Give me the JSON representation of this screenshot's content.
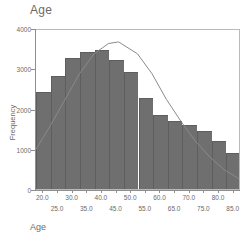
{
  "chart_data": {
    "type": "bar",
    "title": "Age",
    "xlabel": "Age",
    "ylabel": "Frequency",
    "xlim": [
      17.5,
      87.5
    ],
    "ylim": [
      0,
      4000
    ],
    "grid": false,
    "legend": null,
    "bin_width": 5,
    "bin_centers": [
      20.0,
      25.0,
      30.0,
      35.0,
      40.0,
      45.0,
      50.0,
      55.0,
      60.0,
      65.0,
      70.0,
      75.0,
      80.0,
      85.0
    ],
    "bin_edges": [
      17.5,
      22.5,
      27.5,
      32.5,
      37.5,
      42.5,
      47.5,
      52.5,
      57.5,
      62.5,
      67.5,
      72.5,
      77.5,
      82.5,
      87.5
    ],
    "categories": [
      "20.0",
      "25.0",
      "30.0",
      "35.0",
      "40.0",
      "45.0",
      "50.0",
      "55.0",
      "60.0",
      "65.0",
      "70.0",
      "75.0",
      "80.0",
      "85.0"
    ],
    "values": [
      2400,
      2800,
      3250,
      3400,
      3450,
      3200,
      2900,
      2250,
      1850,
      1700,
      1600,
      1450,
      1200,
      900
    ],
    "xticks_row1": [
      "20.0",
      "30.0",
      "40.0",
      "50.0",
      "60.0",
      "70.0",
      "80.0"
    ],
    "xticks_row1_values": [
      20.0,
      30.0,
      40.0,
      50.0,
      60.0,
      70.0,
      80.0
    ],
    "xticks_row2": [
      "25.0",
      "35.0",
      "45.0",
      "55.0",
      "65.0",
      "75.0",
      "85.0"
    ],
    "xticks_row2_values": [
      25.0,
      35.0,
      45.0,
      55.0,
      65.0,
      75.0,
      85.0
    ],
    "yticks": [
      "0",
      "1000",
      "2000",
      "3000",
      "4000"
    ],
    "yticks_values": [
      0,
      1000,
      2000,
      3000,
      4000
    ],
    "overlay": {
      "name": "normal-curve",
      "type": "line",
      "mean": 46.0,
      "peak_value": 3700,
      "x": [
        17.5,
        22.5,
        27.5,
        32.5,
        37.5,
        42.5,
        46.0,
        52.5,
        57.5,
        62.5,
        67.5,
        72.5,
        77.5,
        82.5,
        87.5
      ],
      "y": [
        1000,
        1600,
        2250,
        2900,
        3400,
        3660,
        3700,
        3400,
        2900,
        2250,
        1700,
        1200,
        800,
        480,
        260
      ]
    },
    "colors": {
      "bar_fill": "#6f6f6f",
      "bar_edge": "#5e5e5e",
      "curve": "#8a8a8a",
      "axis": "#8e8e8e",
      "frame": "#b9b9b9",
      "text": "#6a6a6a",
      "background": "#ffffff"
    }
  }
}
